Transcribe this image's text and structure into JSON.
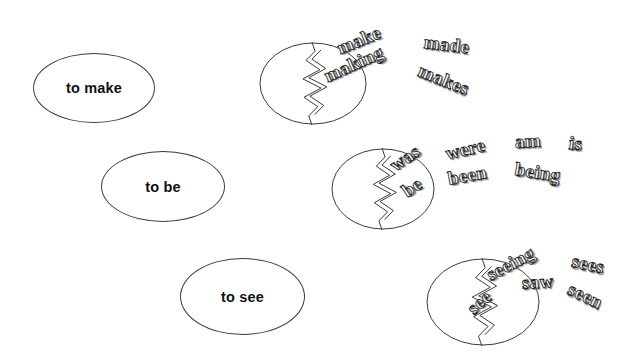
{
  "canvas": {
    "width": 642,
    "height": 361,
    "background": "#ffffff",
    "outline_color": "#3a3a40",
    "label_color": "#101014",
    "word_fill": "#fdfdfd",
    "word_outline": "#1c1c20"
  },
  "rows": [
    {
      "id": "make",
      "infinitive": {
        "label": "to make",
        "x": 33,
        "y": 53,
        "w": 122,
        "h": 70
      },
      "egg": {
        "name": "cracked-egg-make",
        "x": 259,
        "y": 42,
        "w": 108,
        "h": 83
      },
      "words": [
        {
          "text": "make",
          "x": 338,
          "y": 38,
          "rot": -22,
          "size": 19
        },
        {
          "text": "made",
          "x": 424,
          "y": 31,
          "rot": 7,
          "size": 19
        },
        {
          "text": "making",
          "x": 325,
          "y": 66,
          "rot": -24,
          "size": 19
        },
        {
          "text": "makes",
          "x": 419,
          "y": 59,
          "rot": 22,
          "size": 19
        }
      ]
    },
    {
      "id": "be",
      "infinitive": {
        "label": "to be",
        "x": 101,
        "y": 151,
        "w": 124,
        "h": 71
      },
      "egg": {
        "name": "cracked-egg-be",
        "x": 331,
        "y": 148,
        "w": 104,
        "h": 82
      },
      "words": [
        {
          "text": "was",
          "x": 392,
          "y": 156,
          "rot": -34,
          "size": 19
        },
        {
          "text": "were",
          "x": 446,
          "y": 143,
          "rot": -13,
          "size": 19
        },
        {
          "text": "am",
          "x": 515,
          "y": 131,
          "rot": -3,
          "size": 19
        },
        {
          "text": "is",
          "x": 569,
          "y": 132,
          "rot": 6,
          "size": 19
        },
        {
          "text": "be",
          "x": 404,
          "y": 182,
          "rot": -34,
          "size": 19
        },
        {
          "text": "been",
          "x": 448,
          "y": 168,
          "rot": -10,
          "size": 19
        },
        {
          "text": "being",
          "x": 515,
          "y": 158,
          "rot": 9,
          "size": 19
        }
      ]
    },
    {
      "id": "see",
      "infinitive": {
        "label": "to see",
        "x": 180,
        "y": 258,
        "w": 125,
        "h": 77
      },
      "egg": {
        "name": "cracked-egg-see",
        "x": 426,
        "y": 258,
        "w": 114,
        "h": 88
      },
      "words": [
        {
          "text": "seeing",
          "x": 488,
          "y": 265,
          "rot": -28,
          "size": 19
        },
        {
          "text": "sees",
          "x": 572,
          "y": 250,
          "rot": 12,
          "size": 19
        },
        {
          "text": "see",
          "x": 470,
          "y": 300,
          "rot": -42,
          "size": 19
        },
        {
          "text": "saw",
          "x": 522,
          "y": 272,
          "rot": -3,
          "size": 19
        },
        {
          "text": "seen",
          "x": 569,
          "y": 277,
          "rot": 26,
          "size": 19
        }
      ]
    }
  ]
}
